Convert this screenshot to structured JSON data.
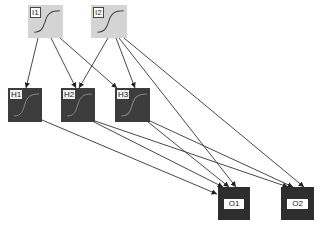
{
  "diagram": {
    "type": "neural-network",
    "colors": {
      "input_fill": "#d4d4d4",
      "hidden_fill": "#3c3c3c",
      "output_fill": "#2e2e2e",
      "edge": "#333333",
      "curve_input": "#444444",
      "curve_hidden": "#888888"
    },
    "nodes": [
      {
        "id": "I1",
        "label": "I1",
        "layer": "input",
        "x": 28,
        "y": 5,
        "w": 35,
        "h": 33,
        "icon": "sigmoid-curve"
      },
      {
        "id": "I2",
        "label": "I2",
        "layer": "input",
        "x": 91,
        "y": 5,
        "w": 36,
        "h": 33,
        "icon": "sigmoid-curve"
      },
      {
        "id": "H1",
        "label": "H1",
        "layer": "hidden",
        "x": 8,
        "y": 88,
        "w": 34,
        "h": 34,
        "icon": "sigmoid-curve"
      },
      {
        "id": "H2",
        "label": "H2",
        "layer": "hidden",
        "x": 61,
        "y": 88,
        "w": 34,
        "h": 34,
        "icon": "sigmoid-curve"
      },
      {
        "id": "H3",
        "label": "H3",
        "layer": "hidden",
        "x": 115,
        "y": 88,
        "w": 35,
        "h": 34,
        "icon": "sigmoid-curve"
      },
      {
        "id": "O1",
        "label": "O1",
        "layer": "output",
        "x": 218,
        "y": 187,
        "w": 32,
        "h": 33
      },
      {
        "id": "O2",
        "label": "O2",
        "layer": "output",
        "x": 281,
        "y": 187,
        "w": 33,
        "h": 33
      }
    ],
    "edges": [
      {
        "from": "I1",
        "to": "H1",
        "x1": 38,
        "y1": 38,
        "x2": 26,
        "y2": 88
      },
      {
        "from": "I1",
        "to": "H2",
        "x1": 51,
        "y1": 38,
        "x2": 76,
        "y2": 88
      },
      {
        "from": "I1",
        "to": "H3",
        "x1": 60,
        "y1": 38,
        "x2": 117,
        "y2": 88
      },
      {
        "from": "I2",
        "to": "H2",
        "x1": 108,
        "y1": 38,
        "x2": 79,
        "y2": 88
      },
      {
        "from": "I2",
        "to": "H3",
        "x1": 116,
        "y1": 38,
        "x2": 135,
        "y2": 88
      },
      {
        "from": "I2",
        "to": "O1",
        "x1": 119,
        "y1": 38,
        "x2": 236,
        "y2": 187
      },
      {
        "from": "I2",
        "to": "O2",
        "x1": 124,
        "y1": 38,
        "x2": 304,
        "y2": 187
      },
      {
        "from": "H1",
        "to": "O1",
        "x1": 42,
        "y1": 120,
        "x2": 217,
        "y2": 194
      },
      {
        "from": "H2",
        "to": "O1",
        "x1": 94,
        "y1": 122,
        "x2": 223,
        "y2": 187
      },
      {
        "from": "H2",
        "to": "O2",
        "x1": 95,
        "y1": 121,
        "x2": 288,
        "y2": 187
      },
      {
        "from": "H3",
        "to": "O1",
        "x1": 148,
        "y1": 122,
        "x2": 229,
        "y2": 187
      },
      {
        "from": "H3",
        "to": "O2",
        "x1": 150,
        "y1": 121,
        "x2": 293,
        "y2": 187
      }
    ]
  }
}
